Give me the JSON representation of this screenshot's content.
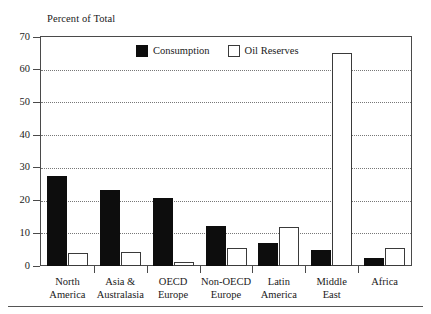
{
  "page": {
    "top_cropped_text": "",
    "bottom_rule": "horizontal-rule"
  },
  "chart": {
    "axis_caption": "Percent of Total",
    "legend": [
      {
        "label": "Consumption",
        "swatch": "filled-square",
        "color": "#0d0d0d"
      },
      {
        "label": "Oil Reserves",
        "swatch": "hollow-square",
        "color": "#ffffff"
      }
    ]
  },
  "chart_data": {
    "type": "bar",
    "title": "",
    "subtitle": "",
    "xlabel": "",
    "ylabel": "Percent of Total",
    "ylim": [
      0,
      70
    ],
    "yticks": [
      0,
      10,
      20,
      30,
      40,
      50,
      60,
      70
    ],
    "ytick_labels": [
      "0",
      "10",
      "20",
      "30",
      "40",
      "50",
      "60",
      "70"
    ],
    "grid": "horizontal-dotted",
    "legend_position": "inside-top-center",
    "categories": [
      "North America",
      "Asia & Australasia",
      "OECD Europe",
      "Non-OECD Europe",
      "Latin America",
      "Middle East",
      "Africa"
    ],
    "category_lines": [
      [
        "North",
        "America"
      ],
      [
        "Asia &",
        "Australasia"
      ],
      [
        "OECD",
        "Europe"
      ],
      [
        "Non-OECD",
        "Europe"
      ],
      [
        "Latin",
        "America"
      ],
      [
        "Middle",
        "East"
      ],
      [
        "Africa",
        ""
      ]
    ],
    "series": [
      {
        "name": "Consumption",
        "color": "#0d0d0d",
        "values": [
          27.5,
          23.3,
          20.7,
          12.3,
          7.1,
          4.8,
          2.5
        ]
      },
      {
        "name": "Oil Reserves",
        "color": "#ffffff",
        "values": [
          4.0,
          4.3,
          1.3,
          5.5,
          11.9,
          65.2,
          5.4
        ]
      }
    ]
  }
}
